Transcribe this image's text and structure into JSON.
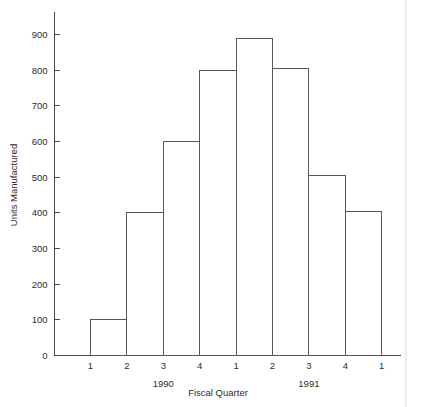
{
  "chart_data": {
    "type": "bar",
    "title": "",
    "subtitle": "",
    "xlabel": "Fiscal Quarter",
    "ylabel": "Units Manufactured",
    "categories": [
      "1",
      "2",
      "3",
      "4",
      "1",
      "2",
      "3",
      "4"
    ],
    "values": [
      100,
      400,
      600,
      800,
      890,
      805,
      505,
      403
    ],
    "series": [
      {
        "name": "Units Manufactured",
        "values": [
          100,
          400,
          600,
          800,
          890,
          805,
          505,
          403
        ]
      }
    ],
    "bar_style": "outline-only",
    "bar_edge_labels": [
      "1",
      "2",
      "3",
      "4",
      "1",
      "2",
      "3",
      "4",
      "1"
    ],
    "group_labels": [
      {
        "label": "1990",
        "spans_edges": [
          0,
          4
        ]
      },
      {
        "label": "1991",
        "spans_edges": [
          4,
          8
        ]
      }
    ],
    "ylim": [
      0,
      940
    ],
    "yticks": [
      0,
      100,
      200,
      300,
      400,
      500,
      600,
      700,
      800,
      900
    ],
    "ytick_labels": [
      "0",
      "100",
      "200",
      "300",
      "400",
      "500",
      "600",
      "700",
      "800",
      "900"
    ],
    "xlim_edges": 9,
    "grid": false,
    "legend": null,
    "legend_position": "none",
    "tick_direction": "in",
    "colors": {
      "background": "#ffffff",
      "axis": "#4a4a4a",
      "bar_stroke": "#585858",
      "text": "#2b2b2b"
    }
  },
  "figure": {
    "caption": "",
    "annotations": []
  }
}
